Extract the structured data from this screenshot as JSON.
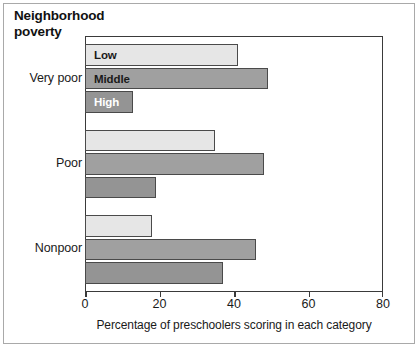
{
  "chart_data": {
    "type": "bar",
    "orientation": "horizontal",
    "title": "Neighborhood\npoverty",
    "xlabel": "Percentage of preschoolers scoring in each category",
    "ylabel": "",
    "categories": [
      "Very poor",
      "Poor",
      "Nonpoor"
    ],
    "xlim": [
      0,
      80
    ],
    "xticks": [
      0,
      20,
      40,
      60,
      80
    ],
    "xtick_labels": [
      "0",
      "20",
      "40",
      "60",
      "80"
    ],
    "grid": false,
    "legend_position": "inside-bars-first-group",
    "series": [
      {
        "name": "Low",
        "values": [
          41,
          35,
          18
        ],
        "color": "#e6e6e6",
        "label_color": "#1a1a1a"
      },
      {
        "name": "Middle",
        "values": [
          49,
          48,
          46
        ],
        "color": "#a0a0a0",
        "label_color": "#1a1a1a"
      },
      {
        "name": "High",
        "values": [
          13,
          19,
          37
        ],
        "color": "#949494",
        "label_color": "#ffffff"
      }
    ],
    "annotations": [
      {
        "text": "Low",
        "in_bar": "Very poor / Low"
      },
      {
        "text": "Middle",
        "in_bar": "Very poor / Middle"
      },
      {
        "text": "High",
        "in_bar": "Very poor / High"
      }
    ]
  },
  "colors": {
    "frame": "#3a3a3a",
    "outer_frame": "#a9a9a9",
    "background": "#ffffff",
    "text": "#1a1a1a"
  }
}
